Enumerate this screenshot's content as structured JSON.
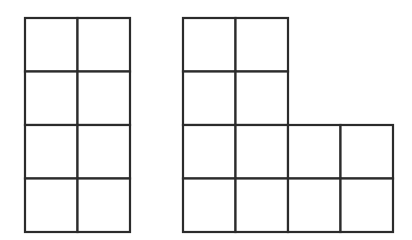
{
  "diagram": {
    "type": "grid-shapes",
    "line_color": "#2b2b2b",
    "background": "#ffffff",
    "cell_size": {
      "w": 52.5,
      "h": 53.5
    },
    "shapes": [
      {
        "name": "rectangle-2x4",
        "description": "2 columns by 4 rows of squares (8 squares)",
        "origin": {
          "x": 25,
          "y": 18
        },
        "cells": [
          [
            0,
            0
          ],
          [
            1,
            0
          ],
          [
            0,
            1
          ],
          [
            1,
            1
          ],
          [
            0,
            2
          ],
          [
            1,
            2
          ],
          [
            0,
            3
          ],
          [
            1,
            3
          ]
        ]
      },
      {
        "name": "l-shape-12",
        "description": "L-shaped figure: 2x4 column with a 2x2 block attached to bottom right (12 squares)",
        "origin": {
          "x": 183,
          "y": 18
        },
        "cells": [
          [
            0,
            0
          ],
          [
            1,
            0
          ],
          [
            0,
            1
          ],
          [
            1,
            1
          ],
          [
            0,
            2
          ],
          [
            1,
            2
          ],
          [
            2,
            2
          ],
          [
            3,
            2
          ],
          [
            0,
            3
          ],
          [
            1,
            3
          ],
          [
            2,
            3
          ],
          [
            3,
            3
          ]
        ]
      }
    ]
  }
}
